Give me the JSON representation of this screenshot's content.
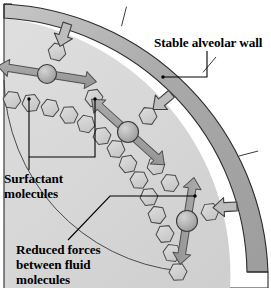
{
  "figure": {
    "type": "anatomical-diagram",
    "background_color": "#ffffff"
  },
  "colors": {
    "wall_band": "#a8a8a8",
    "wall_band_light": "#c2c2c2",
    "interior_fill": "#d8d8d8",
    "interior_fill_light": "#e2e2e2",
    "hexagon_fill": "#cfcfcf",
    "hexagon_stroke": "#4a4a4a",
    "circle_fill": "#b4b4b4",
    "circle_stroke": "#3a3a3a",
    "arrow_gray": "#9a9a9a",
    "arrow_stroke": "#4f4f4f",
    "block_arrow_fill": "#bdbdbd",
    "outline": "#2b2b2b",
    "text": "#000000"
  },
  "labels": [
    {
      "id": "stable-alveolar-wall",
      "lines": [
        "Stable alveolar wall"
      ],
      "x": 154,
      "y": 47,
      "anchor": "start"
    },
    {
      "id": "surfactant-molecules",
      "lines": [
        "Surfactant",
        "molecules"
      ],
      "x": 4,
      "y": 183,
      "anchor": "start"
    },
    {
      "id": "reduced-forces",
      "lines": [
        "Reduced forces",
        "between fluid",
        "molecules"
      ],
      "x": 16,
      "y": 254,
      "anchor": "start"
    }
  ],
  "elements": {
    "wall_label_text": "Stable alveolar wall",
    "surfactant_label_line1": "Surfactant",
    "surfactant_label_line2": "molecules",
    "reduced_label_line1": "Reduced forces",
    "reduced_label_line2": "between fluid",
    "reduced_label_line3": "molecules"
  },
  "geometry": {
    "arc_center_x": -18,
    "arc_center_y": -14,
    "wall_outer_radius": 278,
    "wall_inner_radius": 258,
    "fluid_line_radius": 196,
    "wall_segment_breaks": [
      38,
      62,
      86
    ],
    "canvas": {
      "width": 271,
      "height": 288
    }
  },
  "fluid_molecules": {
    "name": "hexagonal fluid molecules",
    "count_on_rim": 14,
    "count_free": 6,
    "description": "Hexagons packed along the inner fluid layer plus free hexagons in the lumen"
  },
  "surfactant_molecules": {
    "name": "surfactant molecules",
    "count": 3,
    "representation": "gray sphere with double-headed arrow showing reduced attraction",
    "positions": [
      {
        "cx": 47,
        "cy": 74,
        "r": 9.5
      },
      {
        "cx": 128,
        "cy": 132,
        "r": 10.5
      },
      {
        "cx": 187,
        "cy": 221,
        "r": 10.5
      }
    ]
  },
  "inward_arrows": {
    "name": "inward recoil force arrows",
    "count": 3,
    "description": "Hollow block arrows pointing from the wall toward the lumen"
  }
}
